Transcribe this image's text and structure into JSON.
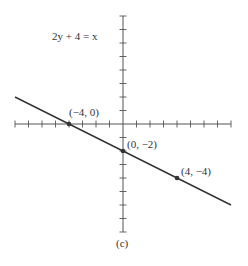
{
  "chart_data": {
    "type": "line",
    "title": "2y + 4 = x",
    "equation": "2y + 4 = x",
    "figure_label": "(c)",
    "xlabel": "",
    "ylabel": "",
    "xlim": [
      -8,
      8
    ],
    "ylim": [
      -8,
      8
    ],
    "tick_spacing": 1,
    "grid": false,
    "points": [
      {
        "x": -4,
        "y": 0,
        "label": "(−4, 0)"
      },
      {
        "x": 0,
        "y": -2,
        "label": "(0, −2)"
      },
      {
        "x": 4,
        "y": -4,
        "label": "(4, −4)"
      }
    ],
    "line": {
      "slope": -0.5,
      "intercept": -2,
      "x_start": -8,
      "x_end": 8
    }
  },
  "colors": {
    "axis": "#555555",
    "line": "#333333",
    "text": "#333333"
  }
}
